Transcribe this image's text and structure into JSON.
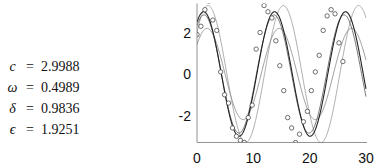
{
  "params": [
    {
      "symbol": "c",
      "value": "2.9988"
    },
    {
      "symbol": "ω",
      "value": "0.4989"
    },
    {
      "symbol": "δ",
      "value": "0.9836"
    },
    {
      "symbol": "ϵ",
      "value": "1.9251"
    }
  ],
  "chart_data": {
    "type": "line",
    "title": "",
    "xlabel": "",
    "ylabel": "",
    "xlim": [
      0,
      30
    ],
    "ylim": [
      -3.3,
      3.4
    ],
    "xticks": [
      0,
      10,
      20,
      30
    ],
    "yticks": [
      2,
      0,
      -2
    ],
    "ytick_labels": [
      "2",
      "0",
      "-2"
    ],
    "xtick_labels": [
      "0",
      "10",
      "20",
      "30"
    ],
    "grid": false,
    "legend": null,
    "series": [
      {
        "name": "fit",
        "model": "c*sin(omega*t+delta)",
        "amplitude": 3.0,
        "omega": 0.4989,
        "phase": 0.9836,
        "color": "#222222",
        "width": 1.1
      },
      {
        "name": "curve-2",
        "amplitude": 2.85,
        "omega": 0.505,
        "phase": 0.95,
        "color": "#555555",
        "width": 0.8
      },
      {
        "name": "curve-3",
        "amplitude": 2.2,
        "omega": 0.49,
        "phase": 0.7,
        "color": "#888888",
        "width": 0.8
      },
      {
        "name": "curve-4",
        "amplitude": 3.3,
        "omega": 0.47,
        "phase": 0.65,
        "color": "#9a9a9a",
        "width": 0.8
      }
    ],
    "points": {
      "x": [
        0,
        0.7,
        1.4,
        2.1,
        2.8,
        3.5,
        4.2,
        4.9,
        5.6,
        6.3,
        7.0,
        7.7,
        8.4,
        9.1,
        9.8,
        10.5,
        11.2,
        11.9,
        12.6,
        13.3,
        14.0,
        14.7,
        15.4,
        16.1,
        16.8,
        17.5,
        18.2,
        18.9,
        19.6,
        20.3,
        21.0,
        21.7,
        22.4,
        23.1,
        23.8,
        24.5,
        25.2,
        25.9,
        26.6,
        27.3,
        28.0,
        28.7,
        29.4
      ],
      "y": [
        1.9,
        2.3,
        3.1,
        3.5,
        2.6,
        2.1,
        0.1,
        -1.0,
        -1.4,
        -2.6,
        -3.0,
        -3.2,
        -3.3,
        -2.1,
        -1.5,
        1.2,
        2.0,
        3.3,
        3.0,
        2.7,
        1.6,
        0.4,
        -0.8,
        -2.1,
        -2.6,
        -3.3,
        -2.9,
        -2.3,
        -1.8,
        -0.8,
        0.1,
        0.9,
        2.1,
        2.8,
        3.1,
        2.9,
        1.5,
        0.6
      ]
    }
  }
}
